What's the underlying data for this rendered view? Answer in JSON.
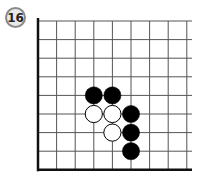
{
  "problem": {
    "number": "16"
  },
  "board": {
    "origin_x": 38,
    "origin_y": 21,
    "spacing": 18.6,
    "cols": 9,
    "rows": 9,
    "right_edge": 192,
    "colors": {
      "line": "#555555",
      "border": "#111111",
      "black": "#000000",
      "white": "#ffffff"
    },
    "stones": [
      {
        "color": "black",
        "col": 3,
        "row": 4
      },
      {
        "color": "black",
        "col": 4,
        "row": 4
      },
      {
        "color": "white",
        "col": 3,
        "row": 5
      },
      {
        "color": "white",
        "col": 4,
        "row": 5
      },
      {
        "color": "black",
        "col": 5,
        "row": 5
      },
      {
        "color": "white",
        "col": 4,
        "row": 6
      },
      {
        "color": "black",
        "col": 5,
        "row": 6
      },
      {
        "color": "black",
        "col": 5,
        "row": 7
      }
    ]
  }
}
